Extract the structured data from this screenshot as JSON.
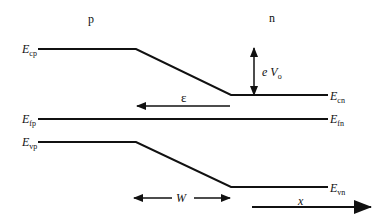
{
  "regions": {
    "p": "p",
    "n": "n"
  },
  "levels": {
    "ecp": {
      "E": "E",
      "sub": "cp"
    },
    "ecn": {
      "E": "E",
      "sub": "cn"
    },
    "efp": {
      "E": "E",
      "sub": "fp"
    },
    "efn": {
      "E": "E",
      "sub": "fn"
    },
    "evp": {
      "E": "E",
      "sub": "vp"
    },
    "evn": {
      "E": "E",
      "sub": "vn"
    }
  },
  "annotations": {
    "barrier": {
      "e": "e",
      "V": "V",
      "sub": "o"
    },
    "field": "ε",
    "width": "W",
    "position": "x"
  },
  "colors": {
    "line": "#111111",
    "background": "#ffffff"
  }
}
